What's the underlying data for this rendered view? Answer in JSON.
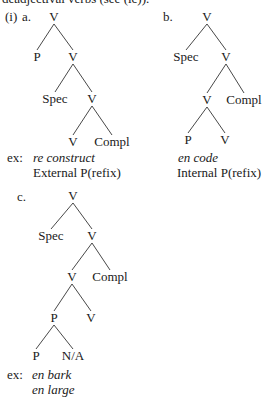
{
  "header_fragment": "deadjectival verbs (see (ic)).",
  "example_number": "(i)",
  "trees": [
    {
      "id": "a",
      "label": "a.",
      "nodes": [
        {
          "id": "a0",
          "text": "V",
          "x": 54,
          "y": 17
        },
        {
          "id": "a1",
          "text": "P",
          "x": 37,
          "y": 57
        },
        {
          "id": "a2",
          "text": "V",
          "x": 73,
          "y": 57
        },
        {
          "id": "a3",
          "text": "Spec",
          "x": 55,
          "y": 99
        },
        {
          "id": "a4",
          "text": "V",
          "x": 92,
          "y": 99
        },
        {
          "id": "a5",
          "text": "V",
          "x": 73,
          "y": 142
        },
        {
          "id": "a6",
          "text": "Compl",
          "x": 112,
          "y": 142
        }
      ],
      "edges": [
        [
          "a0",
          "a1"
        ],
        [
          "a0",
          "a2"
        ],
        [
          "a2",
          "a3"
        ],
        [
          "a2",
          "a4"
        ],
        [
          "a4",
          "a5"
        ],
        [
          "a4",
          "a6"
        ]
      ],
      "example_prefix": "ex:",
      "example": "re construct",
      "caption": "External P(refix)"
    },
    {
      "id": "b",
      "label": "b.",
      "nodes": [
        {
          "id": "b0",
          "text": "V",
          "x": 207,
          "y": 17
        },
        {
          "id": "b1",
          "text": "Spec",
          "x": 186,
          "y": 57
        },
        {
          "id": "b2",
          "text": "V",
          "x": 226,
          "y": 57
        },
        {
          "id": "b3",
          "text": "V",
          "x": 207,
          "y": 100
        },
        {
          "id": "b4",
          "text": "Compl",
          "x": 244,
          "y": 100
        },
        {
          "id": "b5",
          "text": "P",
          "x": 188,
          "y": 140
        },
        {
          "id": "b6",
          "text": "V",
          "x": 225,
          "y": 140
        }
      ],
      "edges": [
        [
          "b0",
          "b1"
        ],
        [
          "b0",
          "b2"
        ],
        [
          "b2",
          "b3"
        ],
        [
          "b2",
          "b4"
        ],
        [
          "b3",
          "b5"
        ],
        [
          "b3",
          "b6"
        ]
      ],
      "example": "en code",
      "caption": "Internal P(refix)"
    },
    {
      "id": "c",
      "label": "c.",
      "nodes": [
        {
          "id": "c0",
          "text": "V",
          "x": 73,
          "y": 196
        },
        {
          "id": "c1",
          "text": "Spec",
          "x": 51,
          "y": 236
        },
        {
          "id": "c2",
          "text": "V",
          "x": 92,
          "y": 236
        },
        {
          "id": "c3",
          "text": "V",
          "x": 72,
          "y": 277
        },
        {
          "id": "c4",
          "text": "Compl",
          "x": 110,
          "y": 277
        },
        {
          "id": "c5",
          "text": "P",
          "x": 54,
          "y": 318
        },
        {
          "id": "c6",
          "text": "V",
          "x": 91,
          "y": 318
        },
        {
          "id": "c7",
          "text": "P",
          "x": 36,
          "y": 356
        },
        {
          "id": "c8",
          "text": "N/A",
          "x": 73,
          "y": 356
        }
      ],
      "edges": [
        [
          "c0",
          "c1"
        ],
        [
          "c0",
          "c2"
        ],
        [
          "c2",
          "c3"
        ],
        [
          "c2",
          "c4"
        ],
        [
          "c3",
          "c5"
        ],
        [
          "c3",
          "c6"
        ],
        [
          "c5",
          "c7"
        ],
        [
          "c5",
          "c8"
        ]
      ],
      "example_prefix": "ex:",
      "examples": [
        "en bark",
        "en large"
      ]
    }
  ]
}
